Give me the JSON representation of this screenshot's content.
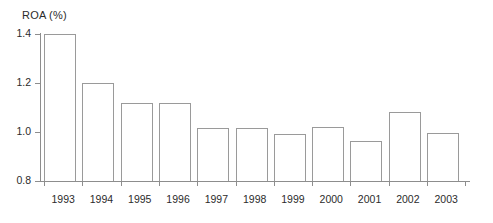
{
  "chart_data": {
    "type": "bar",
    "title": "ROA (%)",
    "xlabel": "",
    "ylabel": "",
    "ylim": [
      0.8,
      1.4
    ],
    "yticks": [
      "0.8",
      "1.0",
      "1.2",
      "1.4"
    ],
    "ytick_values": [
      0.8,
      1.0,
      1.2,
      1.4
    ],
    "grid": false,
    "legend": null,
    "categories": [
      "1993",
      "1994",
      "1995",
      "1996",
      "1997",
      "1998",
      "1999",
      "2000",
      "2001",
      "2002",
      "2003"
    ],
    "values": [
      1.4,
      1.2,
      1.12,
      1.12,
      1.015,
      1.015,
      0.99,
      1.02,
      0.965,
      1.08,
      0.995
    ],
    "bar_style": {
      "fill": "#ffffff",
      "edge": "#9a9a9a"
    },
    "axis_color": "#8d8d8d",
    "text_color": "#2b2b2b"
  }
}
